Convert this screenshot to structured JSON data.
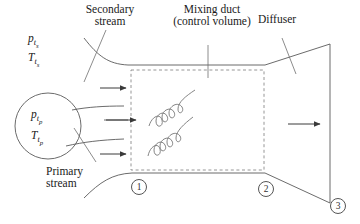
{
  "figure": {
    "type": "engineering-schematic",
    "stroke_color": "#5a5a5a",
    "dashed_color": "#8a8a8a",
    "text_color": "#1a1a1a"
  },
  "labels": {
    "secondary_line1": "Secondary",
    "secondary_line2": "stream",
    "mixing_line1": "Mixing duct",
    "mixing_line2": "(control volume)",
    "diffuser": "Diffuser",
    "primary_line1": "Primary",
    "primary_line2": "stream"
  },
  "variables": {
    "p_total_secondary": "p",
    "p_total_secondary_sub": "t",
    "p_total_secondary_sub2": "s",
    "T_total_secondary": "T",
    "T_total_secondary_sub": "t",
    "T_total_secondary_sub2": "s",
    "p_total_primary": "p",
    "p_total_primary_sub": "t",
    "p_total_primary_sub2": "p",
    "T_total_primary": "T",
    "T_total_primary_sub": "t",
    "T_total_primary_sub2": "p"
  },
  "stations": {
    "one": "1",
    "two": "2",
    "three": "3"
  }
}
